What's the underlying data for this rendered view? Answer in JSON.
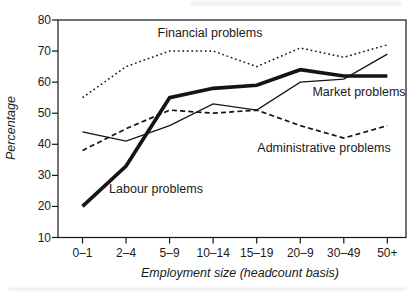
{
  "figure": {
    "background": "#ffffff",
    "ink_color": "#141414",
    "text_color": "#1a1a1a"
  },
  "chart_data": {
    "type": "line",
    "xlabel": "Employment size (headcount basis)",
    "ylabel": "Percentage",
    "ylim": [
      10,
      80
    ],
    "yticks": [
      80,
      70,
      60,
      50,
      40,
      30,
      20,
      10
    ],
    "categories": [
      "0–1",
      "2–4",
      "5–9",
      "10–14",
      "15–19",
      "20–9",
      "30–49",
      "50+"
    ],
    "series": [
      {
        "name": "Financial problems",
        "line_style": "dotted",
        "values": [
          55,
          65,
          70,
          70,
          65,
          71,
          68,
          72
        ]
      },
      {
        "name": "Market problems",
        "line_style": "solid-thin",
        "values": [
          44,
          41,
          46,
          53,
          51,
          60,
          61,
          69
        ]
      },
      {
        "name": "Labour problems",
        "line_style": "solid-thick",
        "values": [
          20,
          33,
          55,
          58,
          59,
          64,
          62,
          62
        ]
      },
      {
        "name": "Administrative problems",
        "line_style": "dashed",
        "values": [
          38,
          45,
          51,
          50,
          51,
          46,
          42,
          46
        ]
      }
    ],
    "legend": "inline labels beside lines",
    "grid": "off"
  }
}
